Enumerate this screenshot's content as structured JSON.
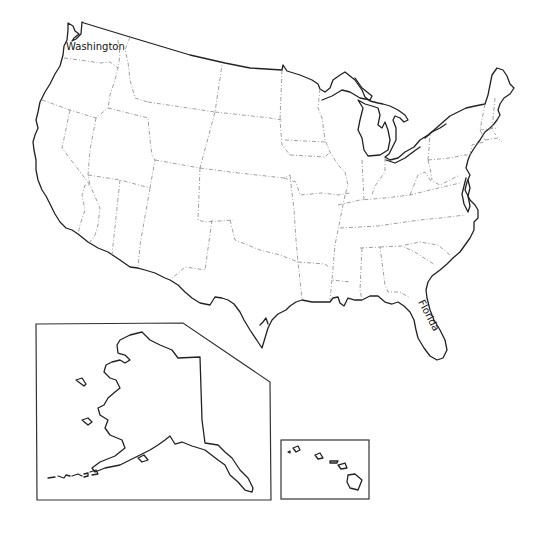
{
  "map": {
    "title": "United States outline map",
    "labels": [
      {
        "name": "washington",
        "text": "Washington",
        "x": 66,
        "y": 50,
        "rotate": 0
      },
      {
        "name": "florida",
        "text": "Florida",
        "x": 418,
        "y": 302,
        "rotate": 62
      }
    ],
    "insets": [
      {
        "name": "alaska",
        "label": "Alaska inset"
      },
      {
        "name": "hawaii",
        "label": "Hawaii inset"
      }
    ],
    "colors": {
      "background": "#ffffff",
      "coastline": "#222222",
      "state_border": "#888888"
    }
  }
}
